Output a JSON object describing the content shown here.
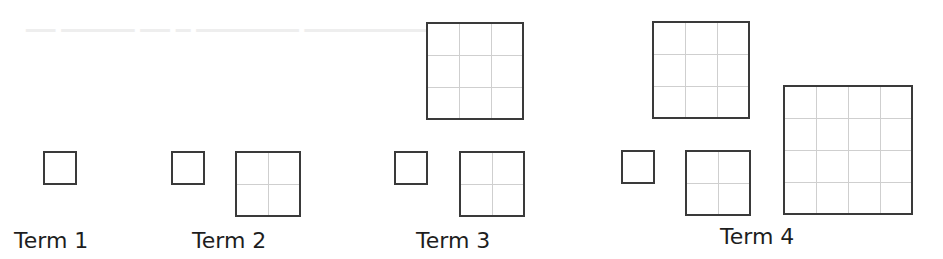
{
  "figure": {
    "cell_size_px": 32,
    "colors": {
      "square_border": "#3a3a3a",
      "grid_line": "#cfcfcf",
      "label_text": "#1e1e1e"
    },
    "terms": [
      {
        "label": "Term 1",
        "label_pos": [
          14,
          228
        ],
        "squares": [
          {
            "side_units": 1,
            "x": 43,
            "y": 151
          }
        ]
      },
      {
        "label": "Term 2",
        "label_pos": [
          192,
          228
        ],
        "squares": [
          {
            "side_units": 1,
            "x": 171,
            "y": 151
          },
          {
            "side_units": 2,
            "x": 235,
            "y": 151
          }
        ]
      },
      {
        "label": "Term 3",
        "label_pos": [
          416,
          228
        ],
        "squares": [
          {
            "side_units": 1,
            "x": 394,
            "y": 151
          },
          {
            "side_units": 2,
            "x": 459,
            "y": 151
          },
          {
            "side_units": 3,
            "x": 426,
            "y": 22
          }
        ]
      },
      {
        "label": "Term 4",
        "label_pos": [
          720,
          224
        ],
        "squares": [
          {
            "side_units": 1,
            "x": 621,
            "y": 150
          },
          {
            "side_units": 2,
            "x": 685,
            "y": 150
          },
          {
            "side_units": 3,
            "x": 652,
            "y": 21
          },
          {
            "side_units": 4,
            "x": 783,
            "y": 85
          }
        ]
      }
    ]
  }
}
